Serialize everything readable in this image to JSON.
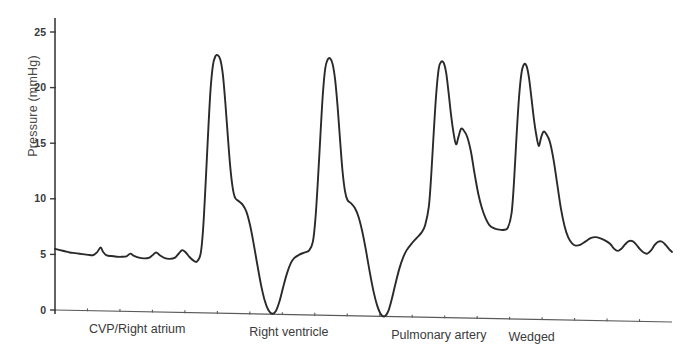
{
  "chart_data": {
    "type": "line",
    "title": "",
    "xlabel": "",
    "ylabel": "Pressure (mmHg)",
    "ylim": [
      0,
      26
    ],
    "yticks": [
      0,
      5,
      10,
      15,
      20,
      25
    ],
    "ytick_labels": [
      "0",
      "5",
      "10",
      "15",
      "20",
      "25"
    ],
    "grid": false,
    "legend": "none",
    "xaxis_ticks_visible": true,
    "xaxis_tick_count": 18,
    "phases": [
      {
        "name": "cvp-right-atrium",
        "label": "CVP/Right atrium",
        "x_start": 0.0,
        "x_end": 0.24,
        "label_x": 0.055,
        "mean_pressure": 5.3,
        "description": "low amplitude a-c-v venous waveform"
      },
      {
        "name": "right-ventricle",
        "label": "Right ventricle",
        "x_start": 0.24,
        "x_end": 0.5,
        "label_x": 0.315,
        "systolic": 23,
        "diastolic": 0,
        "description": "tall spikes from 0 to 23 mmHg"
      },
      {
        "name": "pulmonary-artery",
        "label": "Pulmonary artery",
        "x_start": 0.5,
        "x_end": 0.7,
        "label_x": 0.545,
        "systolic": 23,
        "diastolic": 8,
        "dicrotic_notch": 16.5,
        "description": "peaks 23 with dicrotic notch, diastole 8"
      },
      {
        "name": "wedged",
        "label": "Wedged",
        "x_start": 0.7,
        "x_end": 1.0,
        "label_x": 0.735,
        "mean_pressure": 7,
        "description": "damped low amplitude oscillation ~6-8 mmHg"
      }
    ],
    "series": [
      {
        "name": "pressure-trace",
        "color": "#2a2a2a",
        "points": [
          [
            0.0,
            5.5
          ],
          [
            0.008,
            5.4
          ],
          [
            0.016,
            5.3
          ],
          [
            0.024,
            5.2
          ],
          [
            0.032,
            5.15
          ],
          [
            0.04,
            5.1
          ],
          [
            0.048,
            5.05
          ],
          [
            0.056,
            5.0
          ],
          [
            0.062,
            5.0
          ],
          [
            0.068,
            5.25
          ],
          [
            0.074,
            5.7
          ],
          [
            0.078,
            5.3
          ],
          [
            0.084,
            5.0
          ],
          [
            0.092,
            4.95
          ],
          [
            0.1,
            4.9
          ],
          [
            0.108,
            4.9
          ],
          [
            0.116,
            4.95
          ],
          [
            0.122,
            5.2
          ],
          [
            0.128,
            5.0
          ],
          [
            0.136,
            4.85
          ],
          [
            0.144,
            4.8
          ],
          [
            0.152,
            4.85
          ],
          [
            0.158,
            5.1
          ],
          [
            0.164,
            5.35
          ],
          [
            0.17,
            5.1
          ],
          [
            0.178,
            4.85
          ],
          [
            0.186,
            4.8
          ],
          [
            0.194,
            4.9
          ],
          [
            0.2,
            5.25
          ],
          [
            0.206,
            5.6
          ],
          [
            0.212,
            5.4
          ],
          [
            0.218,
            5.0
          ],
          [
            0.224,
            4.7
          ],
          [
            0.23,
            4.6
          ],
          [
            0.236,
            5.3
          ],
          [
            0.24,
            7.5
          ],
          [
            0.244,
            11.5
          ],
          [
            0.248,
            16.0
          ],
          [
            0.252,
            20.0
          ],
          [
            0.256,
            22.3
          ],
          [
            0.26,
            23.1
          ],
          [
            0.264,
            23.2
          ],
          [
            0.268,
            22.8
          ],
          [
            0.272,
            21.5
          ],
          [
            0.276,
            19.0
          ],
          [
            0.28,
            16.0
          ],
          [
            0.284,
            13.2
          ],
          [
            0.288,
            11.3
          ],
          [
            0.292,
            10.4
          ],
          [
            0.298,
            10.1
          ],
          [
            0.304,
            9.8
          ],
          [
            0.31,
            9.2
          ],
          [
            0.316,
            8.0
          ],
          [
            0.322,
            6.3
          ],
          [
            0.328,
            4.4
          ],
          [
            0.334,
            2.6
          ],
          [
            0.34,
            1.2
          ],
          [
            0.346,
            0.35
          ],
          [
            0.352,
            0.05
          ],
          [
            0.358,
            0.3
          ],
          [
            0.364,
            1.2
          ],
          [
            0.37,
            2.5
          ],
          [
            0.376,
            3.7
          ],
          [
            0.382,
            4.6
          ],
          [
            0.388,
            5.1
          ],
          [
            0.396,
            5.4
          ],
          [
            0.404,
            5.6
          ],
          [
            0.412,
            5.8
          ],
          [
            0.418,
            6.6
          ],
          [
            0.422,
            8.6
          ],
          [
            0.426,
            12.0
          ],
          [
            0.43,
            16.0
          ],
          [
            0.434,
            19.8
          ],
          [
            0.438,
            22.2
          ],
          [
            0.442,
            23.0
          ],
          [
            0.446,
            23.1
          ],
          [
            0.45,
            22.6
          ],
          [
            0.454,
            21.2
          ],
          [
            0.458,
            18.8
          ],
          [
            0.462,
            15.8
          ],
          [
            0.466,
            13.0
          ],
          [
            0.47,
            11.2
          ],
          [
            0.474,
            10.4
          ],
          [
            0.48,
            10.1
          ],
          [
            0.486,
            9.7
          ],
          [
            0.492,
            8.9
          ],
          [
            0.498,
            7.6
          ],
          [
            0.504,
            5.9
          ],
          [
            0.51,
            4.0
          ],
          [
            0.516,
            2.3
          ],
          [
            0.522,
            1.0
          ],
          [
            0.528,
            0.2
          ],
          [
            0.534,
            0.0
          ],
          [
            0.54,
            0.45
          ],
          [
            0.546,
            1.6
          ],
          [
            0.552,
            3.0
          ],
          [
            0.558,
            4.3
          ],
          [
            0.564,
            5.3
          ],
          [
            0.57,
            6.0
          ],
          [
            0.578,
            6.6
          ],
          [
            0.586,
            7.1
          ],
          [
            0.594,
            7.6
          ],
          [
            0.6,
            8.3
          ],
          [
            0.606,
            10.0
          ],
          [
            0.61,
            13.0
          ],
          [
            0.614,
            16.8
          ],
          [
            0.618,
            20.2
          ],
          [
            0.622,
            22.4
          ],
          [
            0.626,
            23.0
          ],
          [
            0.63,
            22.9
          ],
          [
            0.634,
            22.0
          ],
          [
            0.638,
            20.2
          ],
          [
            0.642,
            18.2
          ],
          [
            0.646,
            16.6
          ],
          [
            0.65,
            15.6
          ],
          [
            0.654,
            16.3
          ],
          [
            0.658,
            17.0
          ],
          [
            0.662,
            16.9
          ],
          [
            0.668,
            16.3
          ],
          [
            0.674,
            15.0
          ],
          [
            0.68,
            13.0
          ],
          [
            0.686,
            11.2
          ],
          [
            0.692,
            9.9
          ],
          [
            0.698,
            9.0
          ],
          [
            0.704,
            8.4
          ],
          [
            0.712,
            8.1
          ],
          [
            0.72,
            8.0
          ],
          [
            0.728,
            8.0
          ],
          [
            0.734,
            8.2
          ],
          [
            0.74,
            9.5
          ],
          [
            0.744,
            12.4
          ],
          [
            0.748,
            16.4
          ],
          [
            0.752,
            19.9
          ],
          [
            0.756,
            22.1
          ],
          [
            0.76,
            22.9
          ],
          [
            0.764,
            22.8
          ],
          [
            0.768,
            21.8
          ],
          [
            0.772,
            20.0
          ],
          [
            0.776,
            18.1
          ],
          [
            0.78,
            16.6
          ],
          [
            0.784,
            15.6
          ],
          [
            0.788,
            16.4
          ],
          [
            0.792,
            16.9
          ],
          [
            0.796,
            16.7
          ],
          [
            0.802,
            16.0
          ],
          [
            0.808,
            14.4
          ],
          [
            0.814,
            12.2
          ],
          [
            0.82,
            10.0
          ],
          [
            0.826,
            8.4
          ],
          [
            0.832,
            7.4
          ],
          [
            0.838,
            6.9
          ],
          [
            0.844,
            6.7
          ],
          [
            0.852,
            6.8
          ],
          [
            0.86,
            7.1
          ],
          [
            0.868,
            7.4
          ],
          [
            0.876,
            7.5
          ],
          [
            0.884,
            7.4
          ],
          [
            0.892,
            7.2
          ],
          [
            0.9,
            6.9
          ],
          [
            0.906,
            6.5
          ],
          [
            0.912,
            6.3
          ],
          [
            0.918,
            6.5
          ],
          [
            0.924,
            6.9
          ],
          [
            0.93,
            7.2
          ],
          [
            0.936,
            7.2
          ],
          [
            0.942,
            6.9
          ],
          [
            0.948,
            6.5
          ],
          [
            0.954,
            6.2
          ],
          [
            0.96,
            6.1
          ],
          [
            0.966,
            6.4
          ],
          [
            0.972,
            6.9
          ],
          [
            0.978,
            7.2
          ],
          [
            0.984,
            7.2
          ],
          [
            0.99,
            6.9
          ],
          [
            0.996,
            6.5
          ],
          [
            1.0,
            6.3
          ]
        ]
      }
    ]
  }
}
